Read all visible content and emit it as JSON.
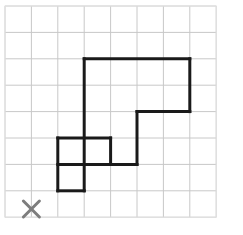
{
  "canvas": {
    "width": 243,
    "height": 235,
    "background": "#ffffff",
    "description": "Grid worksheet with an outlined polygon shape and a gray X marker"
  },
  "grid": {
    "origin_x": 5,
    "origin_y": 6,
    "cell_size": 26.4,
    "columns": 8,
    "rows": 8,
    "line_color": "#c8c8c8",
    "line_width": 1,
    "x_lines": [
      5,
      31.4,
      57.8,
      84.2,
      110.6,
      137,
      163.4,
      189.8,
      216.2
    ],
    "y_lines": [
      6,
      32.4,
      58.8,
      85.2,
      111.6,
      138,
      164.4,
      190.8,
      217.2
    ]
  },
  "shape": {
    "name": "block-polygon",
    "stroke_color": "#1a1a1a",
    "stroke_width": 3,
    "fill": "none",
    "outline_points_px": [
      [
        84.2,
        58.8
      ],
      [
        189.8,
        58.8
      ],
      [
        189.8,
        111.6
      ],
      [
        137,
        111.6
      ],
      [
        137,
        164.4
      ],
      [
        84.2,
        164.4
      ],
      [
        84.2,
        58.8
      ]
    ],
    "outline_points_cells": [
      [
        3,
        2
      ],
      [
        7,
        2
      ],
      [
        7,
        4
      ],
      [
        5,
        4
      ],
      [
        5,
        6
      ],
      [
        3,
        6
      ],
      [
        3,
        2
      ]
    ],
    "extra_squares_px": [
      {
        "name": "left-lower-square",
        "x": 57.8,
        "y": 138,
        "w": 26.4,
        "h": 52.8
      },
      {
        "name": "middle-upper-square",
        "x": 57.8,
        "y": 138,
        "w": 52.8,
        "h": 26.4
      }
    ],
    "segments_px": [
      {
        "name": "top-edge",
        "x1": 84.2,
        "y1": 58.8,
        "x2": 189.8,
        "y2": 58.8
      },
      {
        "name": "right-edge-upper",
        "x1": 189.8,
        "y1": 58.8,
        "x2": 189.8,
        "y2": 111.6
      },
      {
        "name": "step-horizontal",
        "x1": 189.8,
        "y1": 111.6,
        "x2": 137,
        "y2": 111.6
      },
      {
        "name": "step-vertical",
        "x1": 137,
        "y1": 111.6,
        "x2": 137,
        "y2": 164.4
      },
      {
        "name": "lower-horizontal",
        "x1": 137,
        "y1": 164.4,
        "x2": 57.8,
        "y2": 164.4
      },
      {
        "name": "main-left-vertical",
        "x1": 84.2,
        "y1": 58.8,
        "x2": 84.2,
        "y2": 190.8
      },
      {
        "name": "square-top-edge",
        "x1": 57.8,
        "y1": 138,
        "x2": 110.6,
        "y2": 138
      },
      {
        "name": "square-divider-vertical",
        "x1": 110.6,
        "y1": 138,
        "x2": 110.6,
        "y2": 164.4
      },
      {
        "name": "square-left-vertical",
        "x1": 57.8,
        "y1": 138,
        "x2": 57.8,
        "y2": 190.8
      },
      {
        "name": "square-bottom-edge",
        "x1": 57.8,
        "y1": 190.8,
        "x2": 84.2,
        "y2": 190.8
      }
    ]
  },
  "marker": {
    "label": "X",
    "type": "x-cross",
    "color": "#7d7d7d",
    "center_x": 31.4,
    "center_y": 209,
    "arm_length": 8,
    "stroke_width": 3,
    "grid_cell": [
      1,
      7.7
    ]
  },
  "border": {
    "color": "#e3e3e3",
    "width": 1
  }
}
